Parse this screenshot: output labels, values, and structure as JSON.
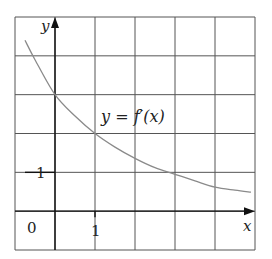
{
  "chart_data": {
    "type": "line",
    "title": "",
    "xlabel": "x",
    "ylabel": "y",
    "xlim": [
      -1,
      5
    ],
    "ylim": [
      -1,
      5
    ],
    "grid": true,
    "grid_step": 1,
    "x_ticks": [
      {
        "value": 1,
        "label": "1"
      }
    ],
    "y_ticks": [
      {
        "value": 1,
        "label": "1"
      }
    ],
    "origin_label": "0",
    "series": [
      {
        "name": "y = f′(x)",
        "x": [
          -0.75,
          -0.5,
          0,
          0.5,
          1,
          1.5,
          2,
          2.5,
          3,
          3.5,
          4,
          4.5,
          4.9
        ],
        "values": [
          4.4,
          3.9,
          3.0,
          2.45,
          2.0,
          1.65,
          1.36,
          1.12,
          0.95,
          0.78,
          0.62,
          0.54,
          0.49
        ]
      }
    ],
    "annotations": [
      {
        "text": "y = f′(x)",
        "x": 1.1,
        "y": 2.25
      }
    ]
  },
  "labels": {
    "y_axis": "y",
    "x_axis": "x",
    "origin": "0",
    "x_tick_1": "1",
    "y_tick_1": "1",
    "curve_label_lhs": "y",
    "curve_label_eq": " = ",
    "curve_label_rhs": "f′(x)"
  },
  "colors": {
    "grid": "#555555",
    "axes": "#111111",
    "curve": "#8a8a8a"
  }
}
